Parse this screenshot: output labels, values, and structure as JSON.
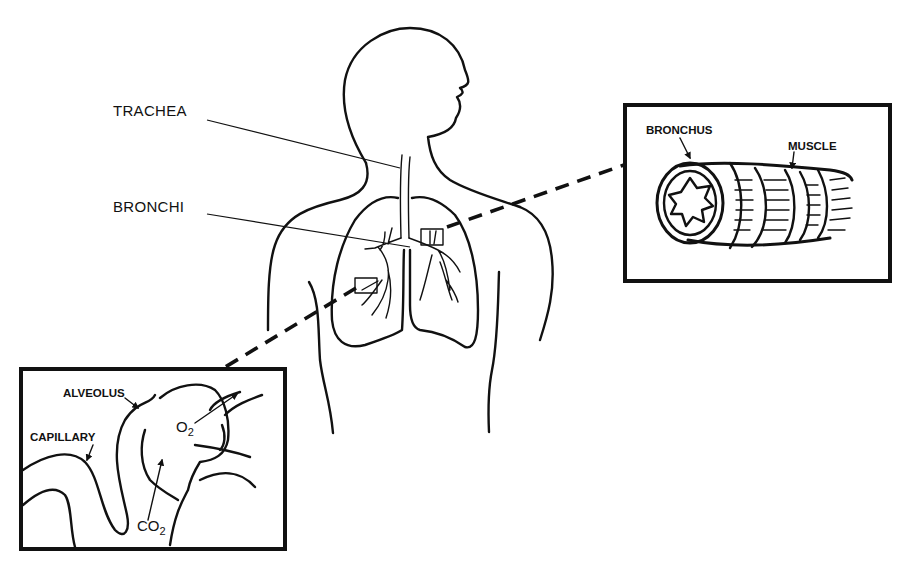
{
  "diagram": {
    "labels": {
      "trachea": "TRACHEA",
      "bronchi": "BRONCHI"
    },
    "inset_bronchus": {
      "bronchus_label": "BRONCHUS",
      "muscle_label": "MUSCLE"
    },
    "inset_alveolus": {
      "alveolus_label": "ALVEOLUS",
      "capillary_label": "CAPILLARY",
      "oxygen": {
        "symbol": "O",
        "subscript": "2"
      },
      "carbon_dioxide": {
        "symbol": "CO",
        "subscript": "2"
      }
    },
    "colors": {
      "ink": "#111111",
      "background": "#ffffff"
    }
  }
}
